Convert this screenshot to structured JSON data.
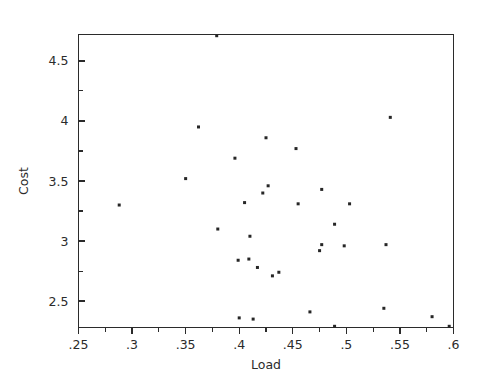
{
  "chart_data": {
    "type": "scatter",
    "title": "",
    "xlabel": "Load",
    "ylabel": "Cost",
    "xlim": [
      0.25,
      0.6
    ],
    "ylim": [
      2.28,
      4.72
    ],
    "grid": false,
    "legend": null,
    "x_ticks": [
      0.25,
      0.3,
      0.35,
      0.4,
      0.45,
      0.5,
      0.55,
      0.6
    ],
    "x_ticklabels": [
      ".25",
      ".3",
      ".35",
      ".4",
      ".45",
      ".5",
      ".55",
      ".6"
    ],
    "x_minor_ticks": [
      0.275,
      0.325,
      0.375,
      0.425,
      0.475,
      0.525,
      0.575
    ],
    "y_ticks": [
      2.5,
      3.0,
      3.5,
      4.0,
      4.5
    ],
    "y_ticklabels": [
      "2.5",
      "3",
      "3.5",
      "4",
      "4.5"
    ],
    "y_minor_ticks": [
      2.75,
      3.25,
      3.75,
      4.25
    ],
    "marker": "square",
    "marker_size": 3,
    "marker_color": "#262626",
    "points": [
      {
        "x": 0.379,
        "y": 4.71
      },
      {
        "x": 0.541,
        "y": 4.03
      },
      {
        "x": 0.362,
        "y": 3.95
      },
      {
        "x": 0.425,
        "y": 3.86
      },
      {
        "x": 0.453,
        "y": 3.77
      },
      {
        "x": 0.396,
        "y": 3.69
      },
      {
        "x": 0.35,
        "y": 3.52
      },
      {
        "x": 0.477,
        "y": 3.43
      },
      {
        "x": 0.427,
        "y": 3.46
      },
      {
        "x": 0.422,
        "y": 3.4
      },
      {
        "x": 0.288,
        "y": 3.3
      },
      {
        "x": 0.405,
        "y": 3.32
      },
      {
        "x": 0.455,
        "y": 3.31
      },
      {
        "x": 0.503,
        "y": 3.31
      },
      {
        "x": 0.489,
        "y": 3.14
      },
      {
        "x": 0.38,
        "y": 3.1
      },
      {
        "x": 0.41,
        "y": 3.04
      },
      {
        "x": 0.477,
        "y": 2.97
      },
      {
        "x": 0.498,
        "y": 2.96
      },
      {
        "x": 0.537,
        "y": 2.97
      },
      {
        "x": 0.475,
        "y": 2.92
      },
      {
        "x": 0.409,
        "y": 2.85
      },
      {
        "x": 0.399,
        "y": 2.84
      },
      {
        "x": 0.417,
        "y": 2.78
      },
      {
        "x": 0.437,
        "y": 2.74
      },
      {
        "x": 0.431,
        "y": 2.71
      },
      {
        "x": 0.535,
        "y": 2.44
      },
      {
        "x": 0.466,
        "y": 2.41
      },
      {
        "x": 0.58,
        "y": 2.37
      },
      {
        "x": 0.4,
        "y": 2.36
      },
      {
        "x": 0.413,
        "y": 2.35
      },
      {
        "x": 0.489,
        "y": 2.29
      },
      {
        "x": 0.596,
        "y": 2.29
      }
    ]
  },
  "figure": {
    "background_color": "#ffffff",
    "foreground_color": "#2b2b2b"
  }
}
